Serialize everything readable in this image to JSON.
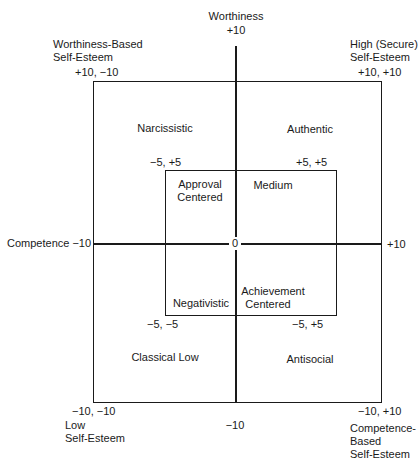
{
  "axes": {
    "top_label": "Worthiness",
    "top_value": "+10",
    "bottom_value": "−10",
    "left_label": "Competence −10",
    "right_value": "+10",
    "origin": "0"
  },
  "corners": {
    "top_left_title": [
      "Worthiness-Based",
      "Self-Esteem"
    ],
    "top_left_coord": "+10, −10",
    "top_right_title": [
      "High (Secure)",
      "Self-Esteem"
    ],
    "top_right_coord": "+10, +10",
    "bottom_left_coord": "−10, −10",
    "bottom_left_title": [
      "Low",
      "Self-Esteem"
    ],
    "bottom_right_coord": "−10, +10",
    "bottom_right_title": [
      "Competence-",
      "Based",
      "Self-Esteem"
    ]
  },
  "outer_quadrants": {
    "top_left": "Narcissistic",
    "top_right": "Authentic",
    "bottom_left": "Classical Low",
    "bottom_right": "Antisocial"
  },
  "inner_box": {
    "coords": {
      "top_left": "−5, +5",
      "top_right": "+5, +5",
      "bottom_left": "−5, −5",
      "bottom_right": "−5, +5"
    },
    "quadrants": {
      "top_left": [
        "Approval",
        "Centered"
      ],
      "top_right": "Medium",
      "bottom_left": "Negativistic",
      "bottom_right": [
        "Achievement",
        "Centered"
      ]
    }
  }
}
